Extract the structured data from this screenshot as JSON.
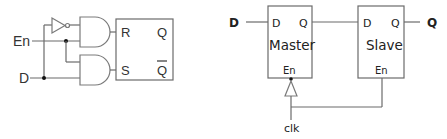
{
  "left_circuit": {
    "title": "Gated D latch (RS latch with AND gates)",
    "inputs": {
      "enable": "En",
      "data": "D"
    },
    "latch": {
      "r_label": "R",
      "s_label": "S",
      "q_label": "Q",
      "qbar_label": "Q"
    }
  },
  "right_circuit": {
    "title": "Master-slave D flip-flop",
    "input_label": "D",
    "output_label": "Q",
    "clock_label": "clk",
    "master": {
      "name": "Master",
      "d_pin": "D",
      "q_pin": "Q",
      "en_pin": "En"
    },
    "slave": {
      "name": "Slave",
      "d_pin": "D",
      "q_pin": "Q",
      "en_pin": "En"
    }
  },
  "colors": {
    "wire": "#6b6b6b",
    "text": "#222222",
    "background": "#ffffff"
  }
}
